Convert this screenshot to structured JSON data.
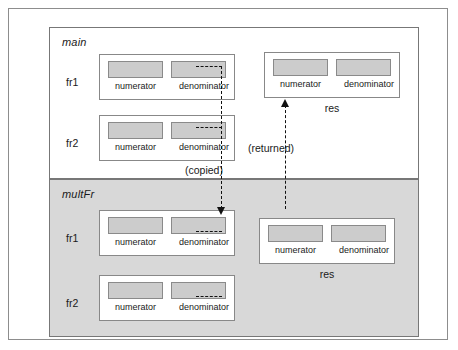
{
  "diagram": {
    "colors": {
      "cell_fill": "#cccccc",
      "frame_main_bg": "#ffffff",
      "frame_mult_bg": "#d8d8d8",
      "line": "#111111",
      "border": "#777777"
    },
    "frames": [
      {
        "name": "main",
        "label": "main",
        "variables": [
          {
            "label": "fr1",
            "fields": [
              {
                "label": "numerator"
              },
              {
                "label": "denominator"
              }
            ]
          },
          {
            "label": "fr2",
            "fields": [
              {
                "label": "numerator"
              },
              {
                "label": "denominator"
              }
            ]
          }
        ],
        "result": {
          "caption": "res",
          "fields": [
            {
              "label": "numerator"
            },
            {
              "label": "denominator"
            }
          ]
        }
      },
      {
        "name": "multFr",
        "label": "multFr",
        "variables": [
          {
            "label": "fr1",
            "fields": [
              {
                "label": "numerator"
              },
              {
                "label": "denominator"
              }
            ]
          },
          {
            "label": "fr2",
            "fields": [
              {
                "label": "numerator"
              },
              {
                "label": "denominator"
              }
            ]
          }
        ],
        "result": {
          "caption": "res",
          "fields": [
            {
              "label": "numerator"
            },
            {
              "label": "denominator"
            }
          ]
        }
      }
    ],
    "edges": [
      {
        "id": "copied",
        "label": "(copied)",
        "direction": "down"
      },
      {
        "id": "returned",
        "label": "(returned)",
        "direction": "up"
      }
    ]
  }
}
